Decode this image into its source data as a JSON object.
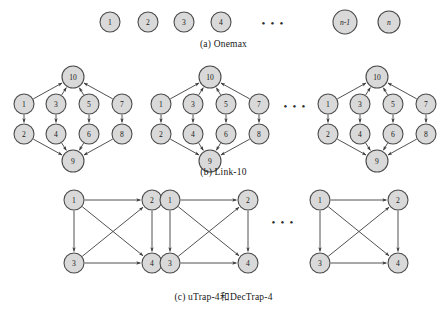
{
  "figure": {
    "width": 447,
    "height": 311,
    "background": "#ffffff",
    "node_fill": "#d9d9d9",
    "node_stroke": "#4a4a4a",
    "edge_color": "#3d3d3d",
    "ellipsis": "• • •"
  },
  "panels": [
    {
      "id": "a",
      "caption": "(a) Onemax",
      "type": "independent-nodes",
      "nodes": [
        {
          "label": "1",
          "italic": false,
          "cx": 110,
          "cy": 22,
          "r": 10
        },
        {
          "label": "2",
          "italic": false,
          "cx": 148,
          "cy": 22,
          "r": 10
        },
        {
          "label": "3",
          "italic": false,
          "cx": 184,
          "cy": 22,
          "r": 10
        },
        {
          "label": "4",
          "italic": false,
          "cx": 221,
          "cy": 22,
          "r": 10
        },
        {
          "label": "n-1",
          "italic": true,
          "cx": 345,
          "cy": 22,
          "r": 12
        },
        {
          "label": "n",
          "italic": true,
          "cx": 389,
          "cy": 22,
          "r": 11
        }
      ],
      "ellipses": [
        {
          "x": 273,
          "y": 23
        }
      ],
      "edges": []
    },
    {
      "id": "b",
      "caption": "(b) Link-10",
      "type": "link-10",
      "groups": [
        {
          "ox": 6,
          "oy": 66
        },
        {
          "ox": 143,
          "oy": 66
        },
        {
          "ox": 310,
          "oy": 66
        }
      ],
      "group_nodes": [
        {
          "label": "10",
          "x": 67,
          "y": 11,
          "r": 11
        },
        {
          "label": "1",
          "x": 18,
          "y": 38,
          "r": 10
        },
        {
          "label": "3",
          "x": 50,
          "y": 38,
          "r": 10
        },
        {
          "label": "5",
          "x": 83,
          "y": 38,
          "r": 10
        },
        {
          "label": "7",
          "x": 116,
          "y": 38,
          "r": 10
        },
        {
          "label": "2",
          "x": 18,
          "y": 68,
          "r": 10
        },
        {
          "label": "4",
          "x": 50,
          "y": 68,
          "r": 10
        },
        {
          "label": "6",
          "x": 83,
          "y": 68,
          "r": 10
        },
        {
          "label": "8",
          "x": 116,
          "y": 68,
          "r": 10
        },
        {
          "label": "9",
          "x": 67,
          "y": 95,
          "r": 11
        }
      ],
      "group_edges": [
        {
          "from": "1",
          "to": "10"
        },
        {
          "from": "3",
          "to": "10"
        },
        {
          "from": "5",
          "to": "10"
        },
        {
          "from": "7",
          "to": "10"
        },
        {
          "from": "1",
          "to": "2"
        },
        {
          "from": "3",
          "to": "4"
        },
        {
          "from": "5",
          "to": "6"
        },
        {
          "from": "7",
          "to": "8"
        },
        {
          "from": "2",
          "to": "9"
        },
        {
          "from": "4",
          "to": "9"
        },
        {
          "from": "6",
          "to": "9"
        },
        {
          "from": "8",
          "to": "9"
        }
      ],
      "ellipses": [
        {
          "x": 295,
          "y": 106
        }
      ]
    },
    {
      "id": "c",
      "caption": "(c) uTrap-4和DecTrap-4",
      "type": "trap-4",
      "groups": [
        {
          "ox": 62,
          "oy": 190
        },
        {
          "ox": 158,
          "oy": 190
        },
        {
          "ox": 308,
          "oy": 190
        }
      ],
      "group_nodes": [
        {
          "label": "1",
          "x": 12,
          "y": 10,
          "r": 10
        },
        {
          "label": "2",
          "x": 90,
          "y": 10,
          "r": 10
        },
        {
          "label": "3",
          "x": 12,
          "y": 73,
          "r": 10
        },
        {
          "label": "4",
          "x": 90,
          "y": 73,
          "r": 10
        }
      ],
      "group_edges": [
        {
          "from": "1",
          "to": "2"
        },
        {
          "from": "1",
          "to": "3"
        },
        {
          "from": "1",
          "to": "4"
        },
        {
          "from": "3",
          "to": "2"
        },
        {
          "from": "3",
          "to": "4"
        },
        {
          "from": "2",
          "to": "4"
        }
      ],
      "ellipses": [
        {
          "x": 283,
          "y": 222
        }
      ]
    }
  ]
}
